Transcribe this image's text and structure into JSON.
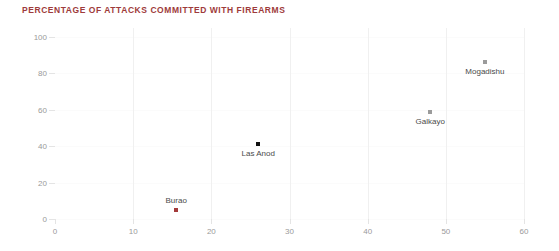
{
  "chart_data": {
    "type": "scatter",
    "title": "PERCENTAGE OF ATTACKS COMMITTED WITH FIREARMS",
    "xlabel": "",
    "ylabel": "",
    "xlim": [
      0,
      60
    ],
    "ylim": [
      0,
      100
    ],
    "xticks": [
      0,
      10,
      20,
      30,
      40,
      50,
      60
    ],
    "yticks": [
      0,
      20,
      40,
      60,
      80,
      100
    ],
    "grid": "faint-vertical",
    "legend": "none",
    "points": [
      {
        "label": "Burao",
        "x": 15.5,
        "y": 5,
        "color": "#a33a3a",
        "label_position": "above"
      },
      {
        "label": "Las Anod",
        "x": 26,
        "y": 41,
        "color": "#111111",
        "label_position": "below"
      },
      {
        "label": "Galkayo",
        "x": 48,
        "y": 59,
        "color": "#9b9b9b",
        "label_position": "below"
      },
      {
        "label": "Mogadishu",
        "x": 55,
        "y": 86,
        "color": "#9b9b9b",
        "label_position": "below"
      }
    ],
    "colors": {
      "title": "#9e3b3b",
      "tick_label": "#9a9a9a",
      "point_label": "#4a4a4a",
      "gridline": "#f0f0f0",
      "axis": "#e6e6e6",
      "background": "#ffffff"
    }
  }
}
